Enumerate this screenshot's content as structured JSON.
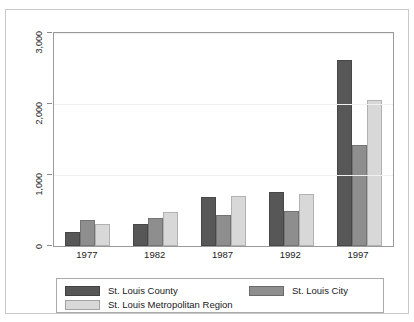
{
  "chart_data": {
    "type": "bar",
    "title": "",
    "xlabel": "",
    "ylabel": "",
    "categories": [
      "1977",
      "1982",
      "1987",
      "1992",
      "1997"
    ],
    "series": [
      {
        "name": "St. Louis County",
        "color": "#575757",
        "values": [
          200,
          310,
          690,
          760,
          2620
        ]
      },
      {
        "name": "St. Louis City",
        "color": "#8e8e8e",
        "values": [
          360,
          400,
          430,
          500,
          1420
        ]
      },
      {
        "name": "St. Louis Metropolitan Region",
        "color": "#d8d8d8",
        "values": [
          310,
          480,
          710,
          730,
          2060
        ]
      }
    ],
    "ylim": [
      0,
      3000
    ],
    "yticks": [
      0,
      1000,
      2000,
      3000
    ],
    "ytick_labels": [
      "0",
      "1,000",
      "2,000",
      "3,000"
    ],
    "grid": true,
    "legend_position": "bottom"
  },
  "legend": {
    "items": [
      {
        "label": "St. Louis County",
        "color": "#575757"
      },
      {
        "label": "St. Louis City",
        "color": "#8e8e8e"
      },
      {
        "label": "St. Louis Metropolitan Region",
        "color": "#d8d8d8"
      }
    ]
  }
}
